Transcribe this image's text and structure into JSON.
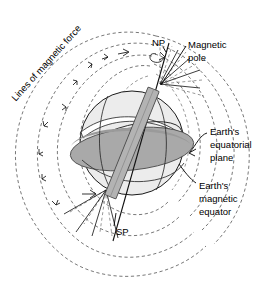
{
  "figure": {
    "background_color": "#ffffff",
    "width": 274,
    "height": 281
  },
  "labels": {
    "lines_of_force": "Lines of magnetic force",
    "north_pole": "NP",
    "south_pole": "SP",
    "magnetic_pole_line1": "Magnetic",
    "magnetic_pole_line2": "pole",
    "equatorial_plane_line1": "Earth's",
    "equatorial_plane_line2": "equatorial",
    "equatorial_plane_line3": "plane",
    "magnetic_equator_line1": "Earth's",
    "magnetic_equator_line2": "magnetic",
    "magnetic_equator_line3": "equator"
  },
  "colors": {
    "sphere_fill": "#ececec",
    "sphere_shade": "#e0e0e0",
    "equatorial_plane_fill": "#a9a9a9",
    "equatorial_plane_dark": "#999999",
    "magnet_bar_fill": "#b3b3b3",
    "magnet_bar_stroke": "#4d4d4d",
    "field_line": "#555555",
    "outline": "#1a1a1a",
    "text": "#000000",
    "background": "#ffffff"
  },
  "geometry": {
    "sphere_center_x": 132,
    "sphere_center_y": 143,
    "sphere_radius": 52,
    "magnet_tilt_degrees": 22,
    "rotation_axis_tilt_degrees": 12
  }
}
